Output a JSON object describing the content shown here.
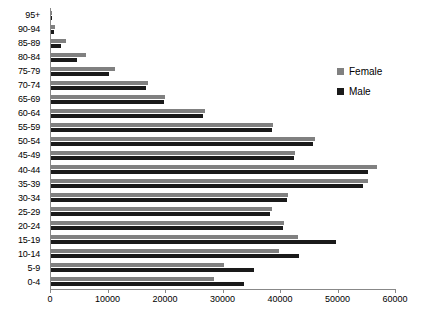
{
  "chart_data": {
    "type": "bar",
    "orientation": "horizontal",
    "title": "",
    "subtitle": "",
    "xlabel": "",
    "ylabel": "",
    "xlim": [
      0,
      60000
    ],
    "ylim": null,
    "grid": false,
    "legend_position": "right",
    "xticks": [
      0,
      10000,
      20000,
      30000,
      40000,
      50000,
      60000
    ],
    "xtick_labels": [
      "0",
      "10000",
      "20000",
      "30000",
      "40000",
      "50000",
      "60000"
    ],
    "categories": [
      "95+",
      "90-94",
      "85-89",
      "80-84",
      "75-79",
      "70-74",
      "65-69",
      "60-64",
      "55-59",
      "50-54",
      "45-49",
      "40-44",
      "35-39",
      "30-34",
      "25-29",
      "20-24",
      "15-19",
      "10-14",
      "5-9",
      "0-4"
    ],
    "series": [
      {
        "name": "Female",
        "color": "#808080",
        "values": [
          200,
          700,
          2600,
          6100,
          11200,
          16800,
          19800,
          26800,
          38600,
          45900,
          42500,
          56700,
          55200,
          41200,
          38400,
          40600,
          42900,
          39600,
          30000,
          28400
        ]
      },
      {
        "name": "Male",
        "color": "#1a1a1a",
        "values": [
          80,
          500,
          1700,
          4600,
          10100,
          16600,
          19600,
          26400,
          38400,
          45600,
          42200,
          55100,
          54300,
          41000,
          38000,
          40400,
          49500,
          43200,
          35300,
          33500
        ]
      }
    ]
  },
  "legend": {
    "items": [
      {
        "label": "Female",
        "color": "#808080"
      },
      {
        "label": "Male",
        "color": "#1a1a1a"
      }
    ]
  }
}
